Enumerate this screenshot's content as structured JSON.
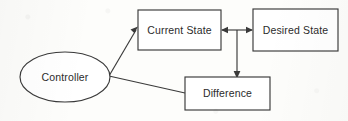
{
  "diagram": {
    "background_color": "#fdfdfb",
    "stroke_color": "#3a3a3a",
    "text_color": "#2b2b2b",
    "nodes": [
      {
        "id": "controller",
        "label": "Controller",
        "shape": "ellipse",
        "cx": 65,
        "cy": 77,
        "rx": 45,
        "ry": 25
      },
      {
        "id": "current_state",
        "label": "Current State",
        "shape": "rectangle",
        "x": 138,
        "y": 10,
        "width": 83,
        "height": 40
      },
      {
        "id": "desired_state",
        "label": "Desired State",
        "shape": "rectangle",
        "x": 253,
        "y": 9,
        "width": 85,
        "height": 42
      },
      {
        "id": "difference",
        "label": "Difference",
        "shape": "rectangle",
        "x": 185,
        "y": 77,
        "width": 85,
        "height": 33
      }
    ],
    "edges": [
      {
        "id": "controller-to-current-state",
        "from": "controller",
        "to": "current_state",
        "arrow": "to-end",
        "style": "diagonal"
      },
      {
        "id": "current-desired-link",
        "from": "current_state",
        "to": "desired_state",
        "arrow": "both-ends",
        "style": "horizontal"
      },
      {
        "id": "link-to-difference",
        "from": "current_state",
        "to": "difference",
        "arrow": "to-end",
        "style": "vertical"
      },
      {
        "id": "difference-to-controller",
        "from": "difference",
        "to": "controller",
        "arrow": "none",
        "style": "diagonal"
      }
    ]
  }
}
